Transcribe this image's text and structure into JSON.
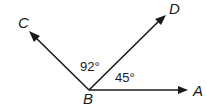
{
  "diagram": {
    "type": "angle-figure",
    "vertex": {
      "name": "B",
      "x": 89,
      "y": 90,
      "label_x": 83,
      "label_y": 104
    },
    "rays": [
      {
        "id": "BC",
        "to": "C",
        "tip_x": 29,
        "tip_y": 31,
        "label_x": 18,
        "label_y": 28
      },
      {
        "id": "BD",
        "to": "D",
        "tip_x": 166,
        "tip_y": 15,
        "label_x": 169,
        "label_y": 14
      },
      {
        "id": "BA",
        "to": "A",
        "tip_x": 188,
        "tip_y": 90,
        "label_x": 193,
        "label_y": 96
      }
    ],
    "angles": [
      {
        "between": [
          "C",
          "B",
          "D"
        ],
        "value": "92°",
        "x": 80,
        "y": 71
      },
      {
        "between": [
          "D",
          "B",
          "A"
        ],
        "value": "45°",
        "x": 115,
        "y": 82
      }
    ],
    "stroke_color": "#1a1a1a"
  }
}
